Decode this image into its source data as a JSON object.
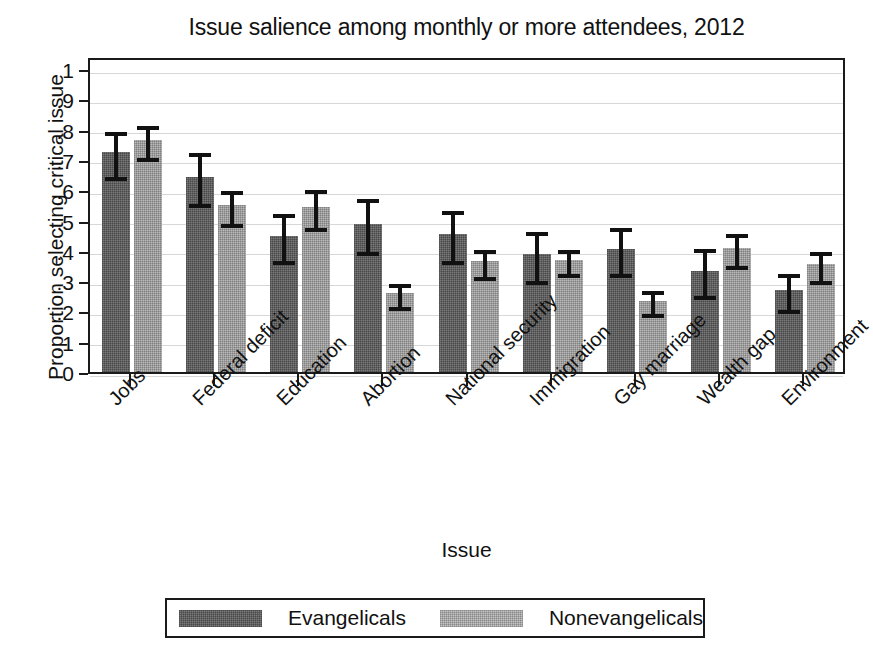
{
  "chart_data": {
    "type": "bar",
    "title": "Issue salience among monthly or more attendees, 2012",
    "xlabel": "Issue",
    "ylabel": "Proportion selecting critical issue",
    "ylim": [
      0,
      1
    ],
    "grid": true,
    "legend_position": "bottom",
    "ytick_labels": [
      "0",
      ".1",
      ".2",
      ".3",
      ".4",
      ".5",
      ".6",
      ".7",
      ".8",
      ".9",
      "1"
    ],
    "ytick_values": [
      0,
      0.1,
      0.2,
      0.3,
      0.4,
      0.5,
      0.6,
      0.7,
      0.8,
      0.9,
      1
    ],
    "categories": [
      "Jobs",
      "Federal deficit",
      "Education",
      "Abortion",
      "National security",
      "Immigration",
      "Gay marriage",
      "Wealth gap",
      "Environment"
    ],
    "series": [
      {
        "name": "Evangelicals",
        "color": "#7a7a7a",
        "values": [
          0.725,
          0.645,
          0.45,
          0.49,
          0.455,
          0.39,
          0.405,
          0.335,
          0.27
        ],
        "ci_low": [
          0.645,
          0.555,
          0.365,
          0.395,
          0.365,
          0.3,
          0.325,
          0.25,
          0.205
        ],
        "ci_high": [
          0.805,
          0.735,
          0.535,
          0.585,
          0.545,
          0.475,
          0.49,
          0.42,
          0.335
        ]
      },
      {
        "name": "Nonevangelicals",
        "color": "#b9b9b9",
        "values": [
          0.765,
          0.55,
          0.545,
          0.26,
          0.365,
          0.37,
          0.235,
          0.41,
          0.355
        ],
        "ci_low": [
          0.705,
          0.49,
          0.475,
          0.215,
          0.315,
          0.325,
          0.19,
          0.35,
          0.3
        ],
        "ci_high": [
          0.825,
          0.61,
          0.615,
          0.305,
          0.415,
          0.415,
          0.28,
          0.47,
          0.41
        ]
      }
    ]
  },
  "legend": {
    "entries": [
      {
        "label": "Evangelicals"
      },
      {
        "label": "Nonevangelicals"
      }
    ]
  }
}
